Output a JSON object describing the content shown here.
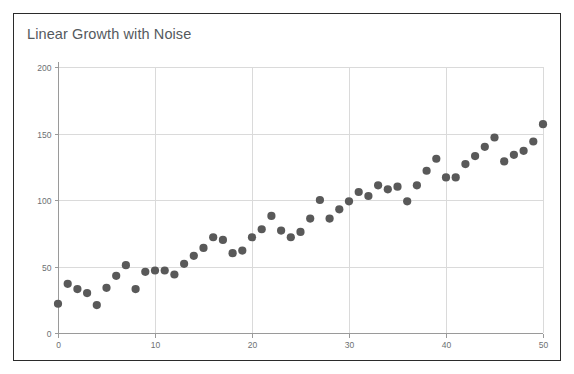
{
  "card": {
    "border_color": "#2b2b2b",
    "background": "#ffffff"
  },
  "chart_data": {
    "type": "scatter",
    "title": "Linear Growth with Noise",
    "xlabel": "",
    "ylabel": "",
    "xlim": [
      0,
      50
    ],
    "ylim": [
      0,
      200
    ],
    "grid": true,
    "legend": null,
    "marker_color": "#595959",
    "grid_color": "#dadada",
    "axis_color": "#9a9a9a",
    "title_color": "#555a5e",
    "xticks": [
      0,
      10,
      20,
      30,
      40,
      50
    ],
    "yticks": [
      0,
      50,
      100,
      150,
      200
    ],
    "xtick_labels": [
      "0",
      "10",
      "20",
      "30",
      "40",
      "50"
    ],
    "ytick_labels": [
      "0",
      "50",
      "100",
      "150",
      "200"
    ],
    "x": [
      0,
      1,
      2,
      3,
      4,
      5,
      6,
      7,
      8,
      9,
      10,
      11,
      12,
      13,
      14,
      15,
      16,
      17,
      18,
      19,
      20,
      21,
      22,
      23,
      24,
      25,
      26,
      27,
      28,
      29,
      30,
      31,
      32,
      33,
      34,
      35,
      36,
      37,
      38,
      39,
      40,
      41,
      42,
      43,
      44,
      45,
      46,
      47,
      48,
      49,
      50
    ],
    "y": [
      22,
      37,
      33,
      30,
      21,
      34,
      43,
      51,
      33,
      46,
      47,
      47,
      44,
      52,
      58,
      64,
      72,
      70,
      60,
      62,
      72,
      78,
      88,
      77,
      72,
      76,
      86,
      100,
      86,
      93,
      99,
      106,
      103,
      111,
      108,
      110,
      99,
      111,
      122,
      131,
      117,
      117,
      127,
      133,
      140,
      147,
      129,
      134,
      137,
      144,
      157
    ]
  }
}
